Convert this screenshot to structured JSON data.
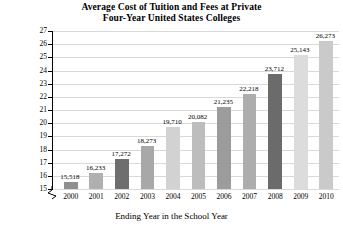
{
  "title": {
    "line1": "Average Cost of Tuition and Fees at Private",
    "line2": "Four-Year United States Colleges"
  },
  "axes": {
    "y_title_line1": "Tuition and Fees",
    "y_title_line2": "(in thousands of dollars)",
    "x_title": "Ending Year in the School Year"
  },
  "chart_data": {
    "type": "bar",
    "title": "Average Cost of Tuition and Fees at Private Four-Year United States Colleges",
    "xlabel": "Ending Year in the School Year",
    "ylabel": "Tuition and Fees (in thousands of dollars)",
    "categories": [
      "2000",
      "2001",
      "2002",
      "2003",
      "2004",
      "2005",
      "2006",
      "2007",
      "2008",
      "2009",
      "2010"
    ],
    "values": [
      15518,
      16233,
      17272,
      18273,
      19710,
      20082,
      21235,
      22218,
      23712,
      25143,
      26273
    ],
    "value_labels": [
      "15,518",
      "16,233",
      "17,272",
      "18,273",
      "19,710",
      "20,082",
      "21,235",
      "22,218",
      "23,712",
      "25,143",
      "26,273"
    ],
    "bar_colors": [
      "#8f8f8f",
      "#b0b0b0",
      "#6e6e6e",
      "#a8a8a8",
      "#d2d2d2",
      "#bdbdbd",
      "#9c9c9c",
      "#adadad",
      "#6b6b6b",
      "#dcdcdc",
      "#cacaca"
    ],
    "ylim": [
      15000,
      27000
    ],
    "y_ticks": [
      15,
      16,
      17,
      18,
      19,
      20,
      21,
      22,
      23,
      24,
      25,
      26,
      27
    ],
    "y_tick_labels": [
      "15",
      "16",
      "17",
      "18",
      "19",
      "20",
      "21",
      "22",
      "23",
      "24",
      "25",
      "26",
      "27"
    ],
    "y_axis_broken": true,
    "grid": true,
    "legend": "none"
  }
}
